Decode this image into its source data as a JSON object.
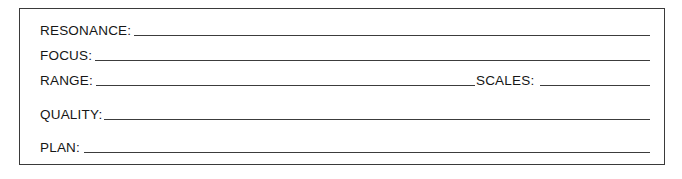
{
  "form": {
    "fields": [
      {
        "label": "RESONANCE:",
        "value": ""
      },
      {
        "label": "FOCUS:",
        "value": ""
      },
      {
        "label": "RANGE:",
        "value": ""
      },
      {
        "label": "SCALES:",
        "value": ""
      },
      {
        "label": "QUALITY:",
        "value": ""
      },
      {
        "label": "PLAN:",
        "value": ""
      }
    ]
  },
  "colors": {
    "text": "#161616",
    "border": "#3a3a3a",
    "underline": "#3c3c3c",
    "background": "#ffffff"
  }
}
